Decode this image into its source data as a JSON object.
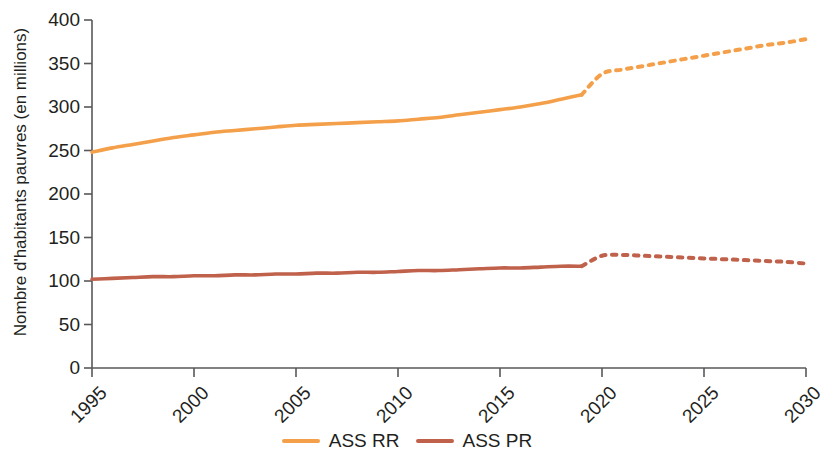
{
  "chart_data": {
    "type": "line",
    "title": "",
    "xlabel": "",
    "ylabel": "Nombre d'habitants pauvres (en millions)",
    "xlim": [
      1995,
      2030
    ],
    "ylim": [
      0,
      400
    ],
    "grid": false,
    "legend_position": "bottom-center",
    "yticks": [
      0,
      50,
      100,
      150,
      200,
      250,
      300,
      350,
      400
    ],
    "ytick_labels": [
      "0",
      "50",
      "100",
      "150",
      "200",
      "250",
      "300",
      "350",
      "400"
    ],
    "xticks": [
      1995,
      2000,
      2005,
      2010,
      2015,
      2020,
      2025,
      2030
    ],
    "xtick_labels": [
      "1995",
      "2000",
      "2005",
      "2010",
      "2015",
      "2020",
      "2025",
      "2030"
    ],
    "series": [
      {
        "name": "ASS RR",
        "color": "#F5A council",
        "colour": "#F4A04A",
        "style_solid": "solid until 2019, dotted (projection) 2019-2030",
        "x": [
          1995,
          1996,
          1997,
          1998,
          1999,
          2000,
          2001,
          2002,
          2003,
          2004,
          2005,
          2006,
          2007,
          2008,
          2009,
          2010,
          2011,
          2012,
          2013,
          2014,
          2015,
          2016,
          2017,
          2018,
          2019
        ],
        "values": [
          248,
          253,
          257,
          261,
          265,
          268,
          271,
          273,
          275,
          277,
          279,
          280,
          281,
          282,
          283,
          284,
          286,
          288,
          291,
          294,
          297,
          300,
          304,
          309,
          314
        ],
        "x_projected": [
          2019,
          2020,
          2021,
          2022,
          2023,
          2024,
          2025,
          2026,
          2027,
          2028,
          2029,
          2030
        ],
        "values_projected": [
          314,
          338,
          343,
          347,
          351,
          355,
          359,
          363,
          367,
          371,
          374,
          378
        ]
      },
      {
        "name": "ASS PR",
        "colour": "#C0614B",
        "style_solid": "solid until 2019, dotted (projection) 2019-2030",
        "x": [
          1995,
          1996,
          1997,
          1998,
          1999,
          2000,
          2001,
          2002,
          2003,
          2004,
          2005,
          2006,
          2007,
          2008,
          2009,
          2010,
          2011,
          2012,
          2013,
          2014,
          2015,
          2016,
          2017,
          2018,
          2019
        ],
        "values": [
          102,
          103,
          104,
          105,
          105,
          106,
          106,
          107,
          107,
          108,
          108,
          109,
          109,
          110,
          110,
          111,
          112,
          112,
          113,
          114,
          115,
          115,
          116,
          117,
          117
        ],
        "x_projected": [
          2019,
          2020,
          2021,
          2022,
          2023,
          2024,
          2025,
          2026,
          2027,
          2028,
          2029,
          2030
        ],
        "values_projected": [
          117,
          129,
          130,
          129,
          128,
          127,
          126,
          125,
          124,
          123,
          122,
          120
        ]
      }
    ]
  },
  "legend": {
    "entries": [
      {
        "label": "ASS RR",
        "color": "#F4A04A"
      },
      {
        "label": "ASS PR",
        "color": "#C0614B"
      }
    ]
  },
  "colors": {
    "axis": "#58585a",
    "text": "#231f20",
    "series_rr": "#F4A04A",
    "series_pr": "#C0614B"
  }
}
